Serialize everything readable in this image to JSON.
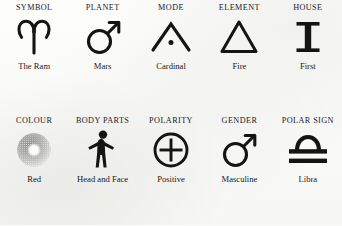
{
  "table": {
    "rows": [
      {
        "cells": [
          {
            "header": "SYMBOL",
            "icon": "aries-ram-glyph",
            "caption": "The Ram"
          },
          {
            "header": "PLANET",
            "icon": "mars-planet-glyph",
            "caption": "Mars"
          },
          {
            "header": "MODE",
            "icon": "cardinal-mode-glyph",
            "caption": "Cardinal"
          },
          {
            "header": "ELEMENT",
            "icon": "fire-triangle-glyph",
            "caption": "Fire"
          },
          {
            "header": "HOUSE",
            "icon": "roman-numeral-one-glyph",
            "caption": "First"
          }
        ]
      },
      {
        "cells": [
          {
            "header": "COLOUR",
            "icon": "colour-swatch-red",
            "caption": "Red"
          },
          {
            "header": "BODY PARTS",
            "icon": "human-body-silhouette",
            "caption": "Head and Face"
          },
          {
            "header": "POLARITY",
            "icon": "circled-plus-glyph",
            "caption": "Positive"
          },
          {
            "header": "GENDER",
            "icon": "mars-masculine-glyph",
            "caption": "Masculine"
          },
          {
            "header": "POLAR SIGN",
            "icon": "libra-glyph",
            "caption": "Libra"
          }
        ]
      }
    ]
  },
  "colors": {
    "ink": "#1a1a1a",
    "paper": "#fbfbfa",
    "swatch_tone": "#8e8e8c"
  }
}
